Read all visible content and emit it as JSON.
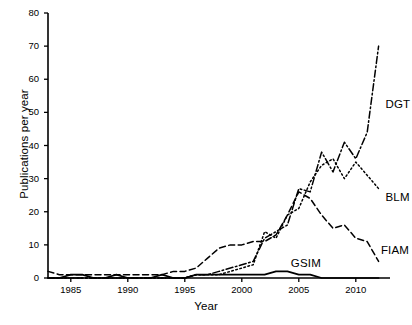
{
  "chart_data": {
    "type": "line",
    "title": "",
    "xlabel": "Year",
    "ylabel": "Publications per year",
    "xlim": [
      1983,
      2013
    ],
    "ylim": [
      0,
      80
    ],
    "xticks": [
      1985,
      1990,
      1995,
      2000,
      2005,
      2010
    ],
    "yticks": [
      0,
      10,
      20,
      30,
      40,
      50,
      60,
      70,
      80
    ],
    "grid": false,
    "legend_position": "inline-end-of-line",
    "x": [
      1983,
      1984,
      1985,
      1986,
      1987,
      1988,
      1989,
      1990,
      1991,
      1992,
      1993,
      1994,
      1995,
      1996,
      1997,
      1998,
      1999,
      2000,
      2001,
      2002,
      2003,
      2004,
      2005,
      2006,
      2007,
      2008,
      2009,
      2010,
      2011,
      2012
    ],
    "series": [
      {
        "name": "DGT",
        "style": "dash-dot",
        "values": [
          0,
          0,
          0,
          0,
          0,
          0,
          0,
          0,
          0,
          0,
          0,
          0,
          0,
          1,
          1,
          2,
          3,
          4,
          5,
          12,
          14,
          16,
          27,
          26,
          38,
          32,
          41,
          36,
          44,
          70
        ]
      },
      {
        "name": "BLM",
        "style": "dotted",
        "values": [
          0,
          0,
          0,
          0,
          0,
          0,
          0,
          0,
          0,
          0,
          0,
          0,
          0,
          1,
          1,
          1,
          2,
          3,
          4,
          14,
          12,
          19,
          21,
          29,
          34,
          36,
          30,
          35,
          31,
          27
        ]
      },
      {
        "name": "FIAM",
        "style": "dashed",
        "values": [
          2,
          1,
          1,
          1,
          1,
          1,
          1,
          1,
          1,
          1,
          1,
          2,
          2,
          3,
          6,
          9,
          10,
          10,
          11,
          11,
          13,
          19,
          26,
          24,
          19,
          15,
          16,
          12,
          11,
          5
        ]
      },
      {
        "name": "GSIM",
        "style": "solid",
        "values": [
          0,
          0,
          1,
          1,
          0,
          0,
          1,
          0,
          0,
          0,
          1,
          0,
          0,
          1,
          1,
          1,
          1,
          1,
          1,
          1,
          2,
          2,
          1,
          1,
          0,
          0,
          0,
          0,
          0,
          0
        ]
      }
    ],
    "annotations": [
      {
        "text": "DGT",
        "x": 2012.6,
        "y": 52
      },
      {
        "text": "BLM",
        "x": 2012.6,
        "y": 24
      },
      {
        "text": "FIAM",
        "x": 2012.2,
        "y": 8
      },
      {
        "text": "GSIM",
        "x": 2004.3,
        "y": 4
      }
    ],
    "colors": {
      "line": "#000000",
      "axis": "#000000",
      "background": "#ffffff"
    }
  }
}
